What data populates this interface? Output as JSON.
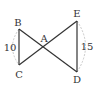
{
  "diagram": {
    "type": "geometry-bowtie",
    "colors": {
      "line": "#333333",
      "dashed": "#bbbbbb",
      "text": "#333333",
      "background": "#ffffff"
    },
    "points": {
      "A": {
        "label": "A",
        "x": 44,
        "y": 48
      },
      "B": {
        "label": "B",
        "x": 19,
        "y": 29
      },
      "C": {
        "label": "C",
        "x": 19,
        "y": 65
      },
      "D": {
        "label": "D",
        "x": 77,
        "y": 72
      },
      "E": {
        "label": "E",
        "x": 77,
        "y": 21
      }
    },
    "segments": [
      {
        "from": "B",
        "to": "C"
      },
      {
        "from": "B",
        "to": "D"
      },
      {
        "from": "E",
        "to": "C"
      },
      {
        "from": "E",
        "to": "D"
      }
    ],
    "measurements": {
      "BC": {
        "value": "10"
      },
      "ED": {
        "value": "15"
      }
    }
  }
}
